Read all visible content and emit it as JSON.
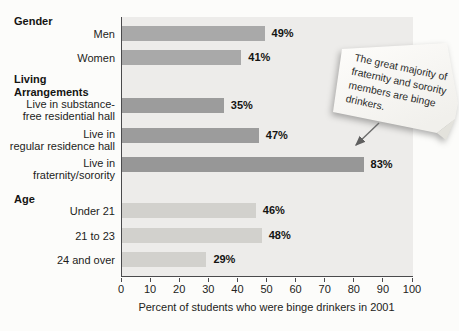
{
  "chart_data": {
    "type": "bar",
    "orientation": "horizontal",
    "xlabel": "Percent of students who were binge drinkers in 2001",
    "xlim": [
      0,
      100
    ],
    "xticks": [
      0,
      10,
      20,
      30,
      40,
      50,
      60,
      70,
      80,
      90,
      100
    ],
    "grid": false,
    "plot_background": "#edecea",
    "axis_color": "#4a4a4c",
    "groups": [
      {
        "id": "gender",
        "header_lines": [
          "Gender"
        ],
        "rows": [
          {
            "id": "men",
            "label_lines": [
              "Men"
            ],
            "value": 49,
            "value_label": "49%",
            "color": "#a9a9a9"
          },
          {
            "id": "women",
            "label_lines": [
              "Women"
            ],
            "value": 41,
            "value_label": "41%",
            "color": "#a9a9a9"
          }
        ]
      },
      {
        "id": "living-arrangements",
        "header_lines": [
          "Living",
          "Arrangements"
        ],
        "rows": [
          {
            "id": "substance-free-hall",
            "label_lines": [
              "Live in substance-",
              "free residential hall"
            ],
            "value": 35,
            "value_label": "35%",
            "color": "#9c9c9c"
          },
          {
            "id": "regular-residence-hall",
            "label_lines": [
              "Live in",
              "regular residence hall"
            ],
            "value": 47,
            "value_label": "47%",
            "color": "#9c9c9c"
          },
          {
            "id": "fraternity-sorority",
            "label_lines": [
              "Live in",
              "fraternity/sorority"
            ],
            "value": 83,
            "value_label": "83%",
            "color": "#979797"
          }
        ]
      },
      {
        "id": "age",
        "header_lines": [
          "Age"
        ],
        "rows": [
          {
            "id": "under-21",
            "label_lines": [
              "Under 21"
            ],
            "value": 46,
            "value_label": "46%",
            "color": "#d2d1cd"
          },
          {
            "id": "21-to-23",
            "label_lines": [
              "21 to 23"
            ],
            "value": 48,
            "value_label": "48%",
            "color": "#d2d1cd"
          },
          {
            "id": "24-and-over",
            "label_lines": [
              "24 and over"
            ],
            "value": 29,
            "value_label": "29%",
            "color": "#d2d1cd"
          }
        ]
      }
    ],
    "annotation": {
      "text": "The great majority of fraternity and sorority members are binge drinkers.",
      "lines": [
        "The great majority of",
        "fraternity and sorority",
        "members are binge",
        "drinkers."
      ],
      "points_to": "fraternity-sorority-bar",
      "style": "sticky-note-with-folded-corner"
    }
  }
}
